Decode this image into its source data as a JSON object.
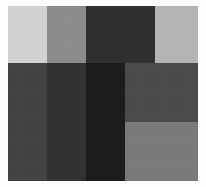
{
  "figure": {
    "background_color": "#ffffff",
    "canvas": {
      "width": 206,
      "height": 187
    },
    "plate": {
      "x": 8,
      "y": 6,
      "width": 190,
      "height": 175
    }
  },
  "chart_data": {
    "type": "heatmap",
    "xlabel": "",
    "ylabel": "",
    "grid": false,
    "legend_position": "none",
    "colorscale": "grayscale",
    "columns": [
      "c1",
      "c2",
      "c3",
      "c4",
      "c5"
    ],
    "rows": [
      "r1",
      "r2",
      "r3"
    ],
    "column_edges_px": [
      8,
      47,
      86,
      125,
      155,
      198
    ],
    "row_edges_px": [
      6,
      63,
      122,
      181
    ],
    "cells": [
      {
        "id": "cell-r1c1",
        "row": 0,
        "col": 0,
        "x": 8,
        "y": 6,
        "width": 39,
        "height": 57,
        "color": "#d2d2d2",
        "value": 210,
        "tone": "light-gray"
      },
      {
        "id": "cell-r1c2",
        "row": 0,
        "col": 1,
        "x": 47,
        "y": 6,
        "width": 39,
        "height": 57,
        "color": "#8c8c8c",
        "value": 140,
        "tone": "mid-gray"
      },
      {
        "id": "cell-r1c3",
        "row": 0,
        "col": 2,
        "x": 86,
        "y": 6,
        "width": 69,
        "height": 57,
        "color": "#2e2e2e",
        "value": 46,
        "tone": "very-dark-gray"
      },
      {
        "id": "cell-r1c5",
        "row": 0,
        "col": 4,
        "x": 155,
        "y": 6,
        "width": 43,
        "height": 57,
        "color": "#b4b4b4",
        "value": 180,
        "tone": "light-mid-gray"
      },
      {
        "id": "cell-r2c1",
        "row": 1,
        "col": 0,
        "x": 8,
        "y": 63,
        "width": 39,
        "height": 59,
        "color": "#414141",
        "value": 65,
        "tone": "dark-gray"
      },
      {
        "id": "cell-r2c2",
        "row": 1,
        "col": 1,
        "x": 47,
        "y": 63,
        "width": 39,
        "height": 59,
        "color": "#303030",
        "value": 48,
        "tone": "very-dark-gray"
      },
      {
        "id": "cell-r2c3",
        "row": 1,
        "col": 2,
        "x": 86,
        "y": 63,
        "width": 39,
        "height": 59,
        "color": "#1a1a1a",
        "value": 26,
        "tone": "near-black"
      },
      {
        "id": "cell-r2c4",
        "row": 1,
        "col": 3,
        "x": 125,
        "y": 63,
        "width": 73,
        "height": 59,
        "color": "#4a4a4a",
        "value": 74,
        "tone": "dark-gray"
      },
      {
        "id": "cell-r3c1",
        "row": 2,
        "col": 0,
        "x": 8,
        "y": 122,
        "width": 39,
        "height": 59,
        "color": "#414141",
        "value": 65,
        "tone": "dark-gray"
      },
      {
        "id": "cell-r3c2",
        "row": 2,
        "col": 1,
        "x": 47,
        "y": 122,
        "width": 39,
        "height": 59,
        "color": "#303030",
        "value": 48,
        "tone": "very-dark-gray"
      },
      {
        "id": "cell-r3c3",
        "row": 2,
        "col": 2,
        "x": 86,
        "y": 122,
        "width": 39,
        "height": 59,
        "color": "#1a1a1a",
        "value": 26,
        "tone": "near-black"
      },
      {
        "id": "cell-r3c4",
        "row": 2,
        "col": 3,
        "x": 125,
        "y": 122,
        "width": 73,
        "height": 59,
        "color": "#7a7a7a",
        "value": 122,
        "tone": "mid-gray"
      }
    ]
  }
}
